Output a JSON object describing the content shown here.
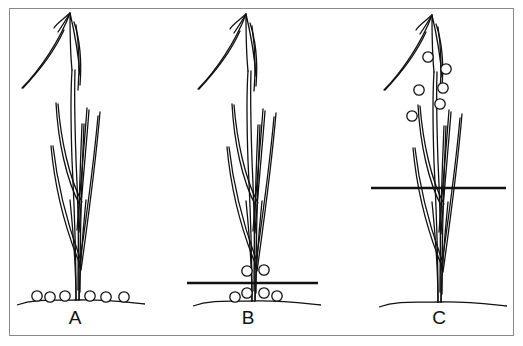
{
  "figure": {
    "panels": [
      {
        "label": "A",
        "label_pos": [
          60,
          307
        ],
        "plant_base_x": 77,
        "ground_y": 300,
        "water_line": null,
        "pellets": [
          [
            37,
            296
          ],
          [
            50,
            297
          ],
          [
            65,
            296
          ],
          [
            90,
            296
          ],
          [
            106,
            297
          ],
          [
            124,
            297
          ]
        ]
      },
      {
        "label": "B",
        "label_pos": [
          233,
          307
        ],
        "plant_base_x": 253,
        "ground_y": 301,
        "water_line": {
          "x1": 187,
          "x2": 318,
          "y": 283
        },
        "pellets": [
          [
            247,
            271
          ],
          [
            264,
            270
          ],
          [
            247,
            293
          ],
          [
            264,
            293
          ],
          [
            235,
            297
          ],
          [
            277,
            296
          ]
        ]
      },
      {
        "label": "C",
        "label_pos": [
          424,
          307
        ],
        "plant_base_x": 439,
        "ground_y": 302,
        "water_line": {
          "x1": 371,
          "x2": 506,
          "y": 188
        },
        "pellets": [
          [
            428,
            57
          ],
          [
            446,
            69
          ],
          [
            419,
            90
          ],
          [
            443,
            88
          ],
          [
            440,
            104
          ],
          [
            412,
            116
          ]
        ]
      }
    ],
    "colors": {
      "line": "#111111",
      "border": "#8a8a8a",
      "background": "#ffffff"
    }
  }
}
